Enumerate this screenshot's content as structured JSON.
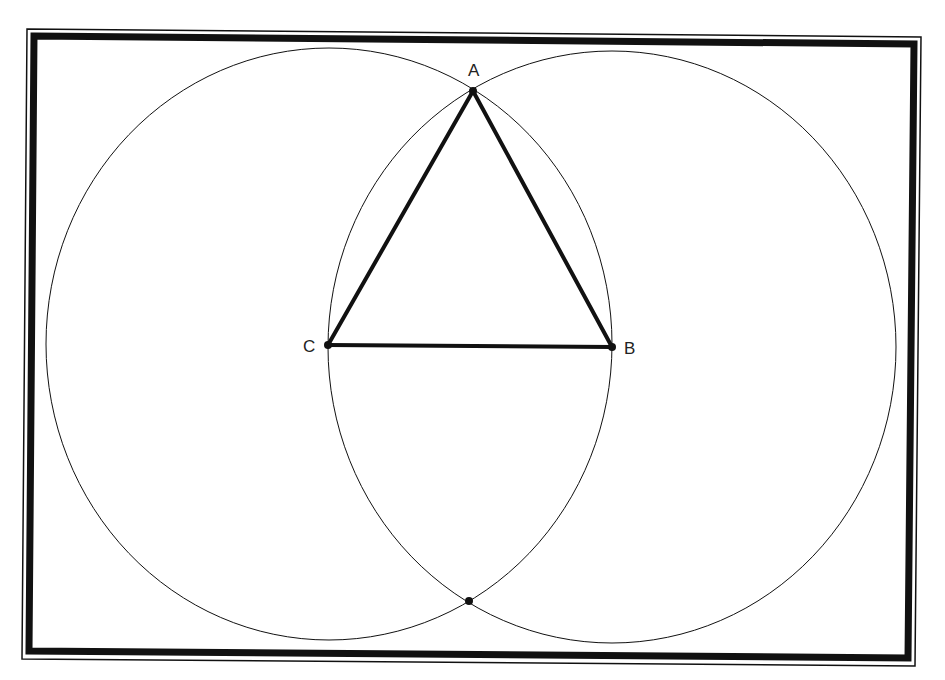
{
  "diagram": {
    "colors": {
      "background": "#ffffff",
      "stroke": "#111111",
      "frame": "#111111"
    },
    "frame": {
      "outer_thin": [
        [
          27,
          29
        ],
        [
          921,
          37
        ],
        [
          915,
          666
        ],
        [
          22,
          659
        ]
      ],
      "inner_thick": [
        [
          34,
          36
        ],
        [
          914,
          44
        ],
        [
          908,
          658
        ],
        [
          29,
          651
        ]
      ],
      "thick_width": 7
    },
    "points": [
      {
        "id": "A",
        "label": "A",
        "x": 473,
        "y": 91,
        "label_x": 468,
        "label_y": 76
      },
      {
        "id": "B",
        "label": "B",
        "x": 612,
        "y": 347,
        "label_x": 624,
        "label_y": 354
      },
      {
        "id": "C",
        "label": "C",
        "x": 328,
        "y": 345,
        "label_x": 303,
        "label_y": 352
      },
      {
        "id": "D",
        "label": "",
        "x": 469,
        "y": 601,
        "label_x": 0,
        "label_y": 0
      }
    ],
    "circles": [
      {
        "id": "circle-C",
        "center": "C",
        "cx": 329,
        "cy": 344,
        "rx": 283,
        "ry": 296
      },
      {
        "id": "circle-B",
        "center": "B",
        "cx": 612,
        "cy": 347,
        "rx": 284,
        "ry": 296
      }
    ],
    "segments": [
      {
        "id": "AB",
        "from": "A",
        "to": "B"
      },
      {
        "id": "BC",
        "from": "B",
        "to": "C"
      },
      {
        "id": "CA",
        "from": "C",
        "to": "A"
      }
    ]
  }
}
